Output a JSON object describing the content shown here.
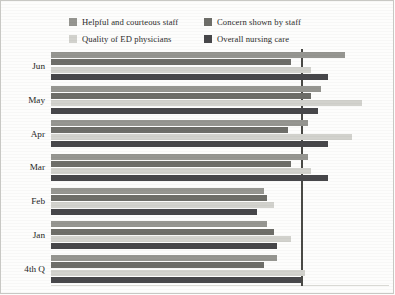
{
  "chart_data": {
    "type": "bar",
    "orientation": "horizontal",
    "title": "",
    "subtitle": "",
    "xlabel": "",
    "ylabel": "",
    "grid": false,
    "legend_position": "top",
    "xlim": [
      0,
      100
    ],
    "categories": [
      "Jun",
      "May",
      "Apr",
      "Mar",
      "Feb",
      "Jan",
      "4th Q"
    ],
    "reference_line": {
      "value": 74,
      "label": "",
      "color": "#4a4a46"
    },
    "series": [
      {
        "name": "Helpful and courteous staff",
        "color": "#969691",
        "values": [
          87,
          80,
          76,
          76,
          63,
          64,
          67
        ]
      },
      {
        "name": "Concern shown by staff",
        "color": "#6e6e69",
        "values": [
          71,
          77,
          70,
          71,
          64,
          66,
          63
        ]
      },
      {
        "name": "Quality of ED physicians",
        "color": "#d2d2cd",
        "values": [
          77,
          92,
          89,
          77,
          66,
          71,
          75
        ]
      },
      {
        "name": "Overall nursing care",
        "color": "#47474a",
        "values": [
          82,
          79,
          82,
          82,
          61,
          67,
          74
        ]
      }
    ]
  },
  "legend": {
    "items": [
      {
        "label": "Helpful and courteous staff",
        "color": "#969691"
      },
      {
        "label": "Concern shown by staff",
        "color": "#6e6e69"
      },
      {
        "label": "Quality of ED physicians",
        "color": "#d2d2cd"
      },
      {
        "label": "Overall nursing care",
        "color": "#47474a"
      }
    ]
  },
  "colors": {
    "background": "#fdfdfc",
    "frame": "#c8c8c4",
    "text": "#26261f",
    "reference_line": "#4a4a46"
  }
}
